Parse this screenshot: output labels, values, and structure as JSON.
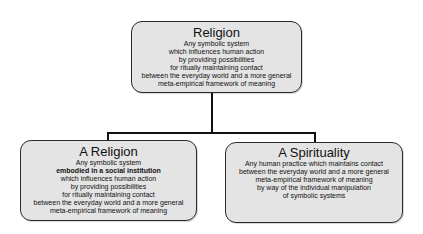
{
  "diagram": {
    "type": "tree",
    "root": {
      "title": "Religion",
      "lines": [
        "Any symbolic system",
        "which influences human action",
        "by providing possibilities",
        "for ritually maintaining contact",
        "between the everyday world and a more general",
        "meta-empirical framework of meaning"
      ]
    },
    "children": [
      {
        "title": "A Religion",
        "lines": [
          "Any symbolic system",
          "embodied in a social institution",
          "which influences human action",
          "by providing possibilities",
          "for ritually maintaining contact",
          "between the everyday world and a more general",
          "meta-empirical framework of meaning"
        ],
        "bold_line_index": 1
      },
      {
        "title": "A Spirituality",
        "lines": [
          "Any human practice which maintains contact",
          "between the everyday world and a more general",
          "meta-empirical framework of meaning",
          "by way of the individual manipulation",
          "of symbolic systems"
        ]
      }
    ],
    "colors": {
      "box_fill": "#e4e4e4",
      "box_border": "#2a2a2a",
      "connector": "#111111",
      "background": "#ffffff"
    }
  }
}
